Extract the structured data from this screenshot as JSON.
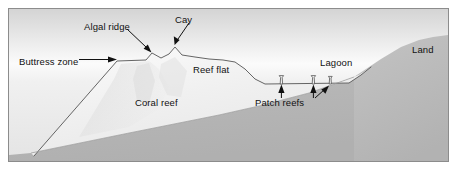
{
  "figure": {
    "type": "cross-section-diagram"
  },
  "colors": {
    "frame_border": "#8c8c8c",
    "water_surface": "#fdfdfd",
    "water_deep": "#d3d3d3",
    "reef_body_light": "#f2f2f2",
    "reef_body_shadow": "#d9d9d9",
    "basement_rock": "#b4b4b4",
    "outline": "#555555",
    "label_text": "#111111",
    "page_background": "#ffffff"
  },
  "labels": {
    "buttress_zone": "Buttress zone",
    "algal_ridge": "Algal ridge",
    "cay": "Cay",
    "reef_flat": "Reef flat",
    "coral_reef": "Coral reef",
    "patch_reefs": "Patch reefs",
    "lagoon": "Lagoon",
    "land": "Land"
  },
  "features": [
    {
      "name": "buttress-zone",
      "label": "Buttress zone",
      "pointer": "horizontal-arrow-right",
      "target_x": 113,
      "target_y": 58
    },
    {
      "name": "algal-ridge",
      "label": "Algal ridge",
      "pointer": "diagonal-arrow-down-right",
      "target_x": 143,
      "target_y": 50
    },
    {
      "name": "cay",
      "label": "Cay",
      "pointer": "diagonal-arrow-down-left",
      "target_x": 165,
      "target_y": 46
    },
    {
      "name": "reef-flat",
      "label": "Reef flat",
      "pointer": "none",
      "target_x": 210,
      "target_y": 64
    },
    {
      "name": "coral-reef",
      "label": "Coral reef",
      "pointer": "none",
      "target_x": 155,
      "target_y": 100
    },
    {
      "name": "patch-reefs",
      "label": "Patch reefs",
      "pointer": "three-arrows-up",
      "target_x": 290,
      "target_y": 80
    },
    {
      "name": "lagoon",
      "label": "Lagoon",
      "pointer": "none",
      "target_x": 330,
      "target_y": 60
    },
    {
      "name": "land",
      "label": "Land",
      "pointer": "none",
      "target_x": 425,
      "target_y": 47
    }
  ],
  "patch_reefs": [
    {
      "x": 273,
      "base_y": 76,
      "height": 10
    },
    {
      "x": 305,
      "base_y": 76,
      "height": 10
    },
    {
      "x": 322,
      "base_y": 76,
      "height": 9
    }
  ],
  "label_positions": {
    "buttress_zone": {
      "x": 18,
      "y": 55
    },
    "algal_ridge": {
      "x": 84,
      "y": 22
    },
    "cay": {
      "x": 172,
      "y": 15
    },
    "reef_flat": {
      "x": 190,
      "y": 63
    },
    "coral_reef": {
      "x": 132,
      "y": 97
    },
    "patch_reefs": {
      "x": 255,
      "y": 85
    },
    "lagoon": {
      "x": 315,
      "y": 54
    },
    "land": {
      "x": 415,
      "y": 42
    }
  }
}
